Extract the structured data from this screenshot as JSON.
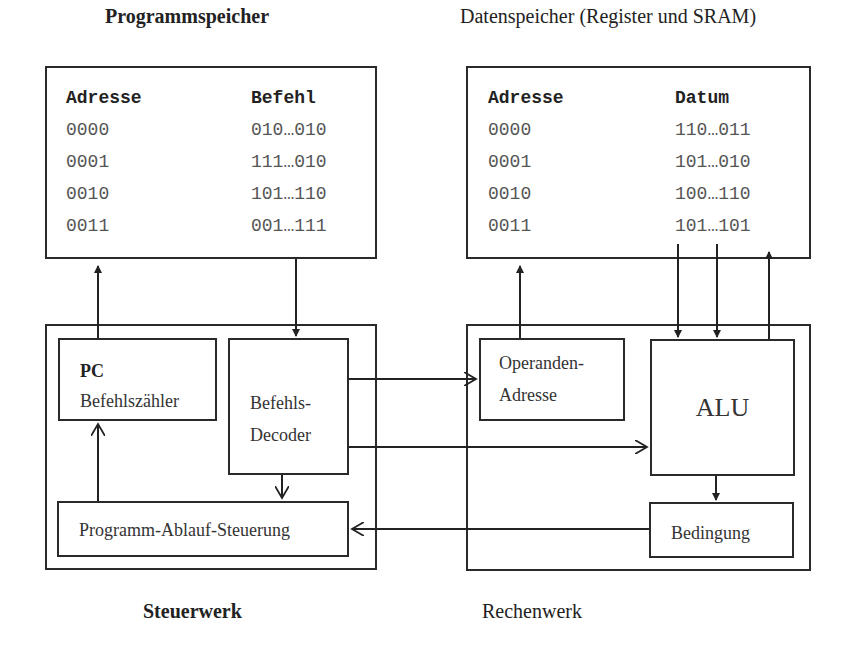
{
  "program_memory": {
    "title": "Programmspeicher",
    "columns": [
      "Adresse",
      "Befehl"
    ],
    "rows": [
      [
        "0000",
        "010…010"
      ],
      [
        "0001",
        "111…010"
      ],
      [
        "0010",
        "101…110"
      ],
      [
        "0011",
        "001…111"
      ]
    ]
  },
  "data_memory": {
    "title": "Datenspeicher (Register und SRAM)",
    "columns": [
      "Adresse",
      "Datum"
    ],
    "rows": [
      [
        "0000",
        "110…011"
      ],
      [
        "0001",
        "101…010"
      ],
      [
        "0010",
        "100…110"
      ],
      [
        "0011",
        "101…101"
      ]
    ]
  },
  "control_unit": {
    "title": "Steuerwerk",
    "pc": {
      "abbr": "PC",
      "label": "Befehlszähler"
    },
    "decoder": {
      "line1": "Befehls-",
      "line2": "Decoder"
    },
    "sequencer": {
      "label": "Programm-Ablauf-Steuerung"
    }
  },
  "arithmetic_unit": {
    "title": "Rechenwerk",
    "operand_address": {
      "line1": "Operanden-",
      "line2": "Adresse"
    },
    "alu": {
      "label": "ALU"
    },
    "condition": {
      "label": "Bedingung"
    }
  }
}
